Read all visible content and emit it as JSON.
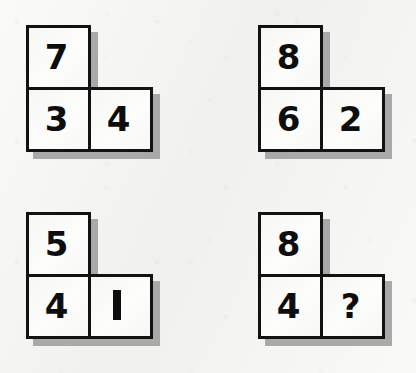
{
  "page": {
    "background_color": "#f5f5f3",
    "tile_fill_color": "#fbfbf9",
    "tile_border_color": "#121212",
    "shadow_color": "#a9a9a9",
    "digit_color": "#0d0d0d"
  },
  "groups": [
    {
      "id": "group-1",
      "name": "top-left-group",
      "top": "7",
      "bottom_left": "3",
      "bottom_right": "4"
    },
    {
      "id": "group-2",
      "name": "top-right-group",
      "top": "8",
      "bottom_left": "6",
      "bottom_right": "2"
    },
    {
      "id": "group-3",
      "name": "bottom-left-group",
      "top": "5",
      "bottom_left": "4",
      "bottom_right": "1"
    },
    {
      "id": "group-4",
      "name": "bottom-right-group",
      "top": "8",
      "bottom_left": "4",
      "bottom_right": "?"
    }
  ]
}
